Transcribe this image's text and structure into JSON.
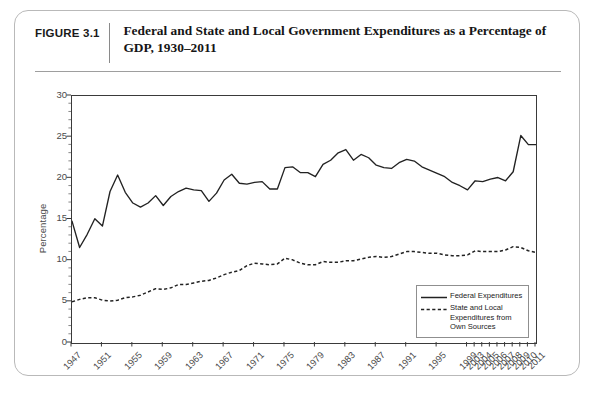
{
  "figure": {
    "number_label": "FIGURE 3.1",
    "title": "Federal and State and Local Government Expenditures as a Percentage of GDP, 1930–2011"
  },
  "chart_data": {
    "type": "line",
    "title": "Federal and State and Local Government Expenditures as a Percentage of GDP, 1930–2011",
    "xlabel": "",
    "ylabel": "Percentage",
    "ylim": [
      0,
      30
    ],
    "yticks": [
      0,
      5,
      10,
      15,
      20,
      25,
      30
    ],
    "ytick_labels": [
      "0",
      "5",
      "10",
      "15",
      "20",
      "25",
      "30"
    ],
    "grid": false,
    "legend_position": "bottom-right",
    "tick_labels_x": [
      "1947",
      "1951",
      "1955",
      "1959",
      "1963",
      "1967",
      "1971",
      "1975",
      "1979",
      "1983",
      "1987",
      "1991",
      "1995",
      "1999",
      "2003",
      "2004",
      "2005",
      "2006",
      "2007",
      "2008",
      "2009",
      "2010",
      "2011"
    ],
    "x": [
      "1947",
      "1948",
      "1949",
      "1950",
      "1951",
      "1952",
      "1953",
      "1954",
      "1955",
      "1956",
      "1957",
      "1958",
      "1959",
      "1960",
      "1961",
      "1962",
      "1963",
      "1964",
      "1965",
      "1966",
      "1967",
      "1968",
      "1969",
      "1970",
      "1971",
      "1972",
      "1973",
      "1974",
      "1975",
      "1976",
      "1977",
      "1978",
      "1979",
      "1980",
      "1981",
      "1982",
      "1983",
      "1984",
      "1985",
      "1986",
      "1987",
      "1988",
      "1989",
      "1990",
      "1991",
      "1992",
      "1993",
      "1994",
      "1995",
      "1996",
      "1997",
      "1998",
      "1999",
      "2003",
      "2004",
      "2005",
      "2006",
      "2007",
      "2008",
      "2009",
      "2010",
      "2011"
    ],
    "series": [
      {
        "name": "Federal Expenditures",
        "style": "solid",
        "color": "#222222",
        "values": [
          14.8,
          11.6,
          13.2,
          15.1,
          14.2,
          18.4,
          20.4,
          18.3,
          17.0,
          16.5,
          17.0,
          17.9,
          16.7,
          17.8,
          18.4,
          18.8,
          18.6,
          18.5,
          17.2,
          18.2,
          19.8,
          20.5,
          19.4,
          19.3,
          19.5,
          19.6,
          18.7,
          18.7,
          21.3,
          21.4,
          20.7,
          20.7,
          20.2,
          21.7,
          22.2,
          23.1,
          23.5,
          22.2,
          22.9,
          22.5,
          21.6,
          21.3,
          21.2,
          21.9,
          22.3,
          22.1,
          21.4,
          21.0,
          20.6,
          20.2,
          19.5,
          19.1,
          18.6,
          19.7,
          19.6,
          19.9,
          20.1,
          19.7,
          20.8,
          25.2,
          24.1,
          24.1
        ]
      },
      {
        "name": "State and Local Expenditures from Own Sources",
        "style": "dotted",
        "color": "#222222",
        "values": [
          5.0,
          5.3,
          5.5,
          5.5,
          5.2,
          5.1,
          5.2,
          5.5,
          5.6,
          5.8,
          6.2,
          6.6,
          6.5,
          6.7,
          7.1,
          7.1,
          7.3,
          7.5,
          7.6,
          7.9,
          8.3,
          8.6,
          8.8,
          9.4,
          9.7,
          9.6,
          9.5,
          9.6,
          10.3,
          10.1,
          9.7,
          9.5,
          9.5,
          9.9,
          9.8,
          9.8,
          10.0,
          10.0,
          10.2,
          10.4,
          10.5,
          10.4,
          10.5,
          10.8,
          11.1,
          11.1,
          11.0,
          10.9,
          10.9,
          10.7,
          10.6,
          10.6,
          10.7,
          11.2,
          11.1,
          11.1,
          11.1,
          11.3,
          11.7,
          11.6,
          11.2,
          11.0
        ]
      }
    ]
  },
  "legend": {
    "items": [
      {
        "label": "Federal Expenditures",
        "style": "solid"
      },
      {
        "label": "State and Local Expenditures from Own Sources",
        "style": "dotted"
      }
    ]
  }
}
